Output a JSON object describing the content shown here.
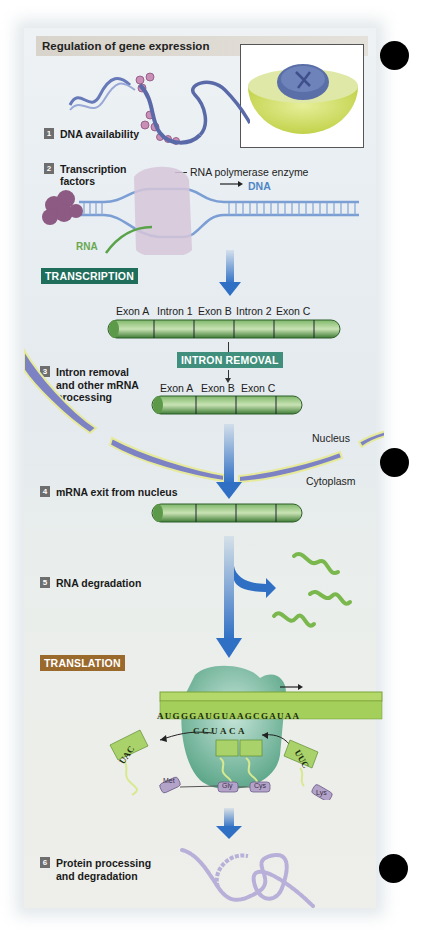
{
  "title": "Regulation of gene expression",
  "steps": [
    {
      "num": "1",
      "label": "DNA availability"
    },
    {
      "num": "2",
      "label_line1": "Transcription",
      "label_line2": "factors"
    },
    {
      "num": "3",
      "label_line1": "Intron removal",
      "label_line2": "and other mRNA",
      "label_line3": "processing"
    },
    {
      "num": "4",
      "label": "mRNA exit from nucleus"
    },
    {
      "num": "5",
      "label": "RNA degradation"
    },
    {
      "num": "6",
      "label_line1": "Protein processing",
      "label_line2": "and degradation"
    }
  ],
  "tags": {
    "transcription": {
      "label": "TRANSCRIPTION",
      "color": "#1f6e5c"
    },
    "intron_removal": {
      "label": "INTRON REMOVAL",
      "color": "#3f8f7c"
    },
    "translation": {
      "label": "TRANSLATION",
      "color": "#9a6a2c"
    }
  },
  "labels": {
    "rna_polymerase": "RNA polymerase enzyme",
    "dna": "DNA",
    "rna": "RNA",
    "nucleus": "Nucleus",
    "cytoplasm": "Cytoplasm"
  },
  "pre_mrna_segments": [
    "Exon A",
    "Intron 1",
    "Exon B",
    "Intron 2",
    "Exon C"
  ],
  "mrna_segments": [
    "Exon A",
    "Exon B",
    "Exon C"
  ],
  "translation": {
    "mrna_sequence": "AUGGGAUGUAAGCGAUAA",
    "bound_anticodons": "CCUACA",
    "exiting_trna_anticodon": "UAC",
    "entering_trna_anticodon": "UUC",
    "amino_acids": [
      "Met",
      "Gly",
      "Cys",
      "Lys"
    ]
  },
  "colors": {
    "arrow_blue": "#2f6fc4",
    "dna_blue": "#4f86c6",
    "rna_green": "#6aa84f",
    "mrna_green": "#4d8f3c",
    "nucleus_membrane": "#6a6fb0",
    "amino_acid_purple": "#b3a3c8"
  }
}
